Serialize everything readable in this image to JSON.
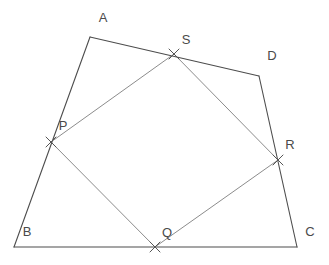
{
  "figure": {
    "width": 329,
    "height": 265,
    "background": "#ffffff"
  },
  "style": {
    "outer_stroke": "#4d4d4d",
    "inner_stroke": "#8c8c8c",
    "marker_stroke": "#555555",
    "label_color": "#4a4a4a",
    "outer_stroke_width": 1.1,
    "inner_stroke_width": 1.0,
    "marker_stroke_width": 1.0,
    "marker_size": 5,
    "label_font_size": 13
  },
  "outer_quadrilateral": {
    "name": "ABCD",
    "vertices": [
      {
        "id": "A",
        "label": "A",
        "x": 90,
        "y": 37,
        "label_x": 103,
        "label_y": 19
      },
      {
        "id": "D",
        "label": "D",
        "x": 259,
        "y": 76,
        "label_x": 272,
        "label_y": 57
      },
      {
        "id": "C",
        "label": "C",
        "x": 297,
        "y": 247,
        "label_x": 310,
        "label_y": 233
      },
      {
        "id": "B",
        "label": "B",
        "x": 14,
        "y": 247,
        "label_x": 27,
        "label_y": 233
      }
    ],
    "edges": [
      {
        "id": "AD",
        "from": "A",
        "to": "D"
      },
      {
        "id": "DC",
        "from": "D",
        "to": "C"
      },
      {
        "id": "CB",
        "from": "C",
        "to": "B"
      },
      {
        "id": "BA",
        "from": "B",
        "to": "A"
      }
    ]
  },
  "inner_quadrilateral": {
    "name": "PSRQ",
    "vertices": [
      {
        "id": "P",
        "label": "P",
        "x": 51,
        "y": 142,
        "label_x": 63,
        "label_y": 127,
        "on_edge": "BA"
      },
      {
        "id": "S",
        "label": "S",
        "x": 174,
        "y": 54,
        "label_x": 186,
        "label_y": 41,
        "on_edge": "AD"
      },
      {
        "id": "R",
        "label": "R",
        "x": 278,
        "y": 160,
        "label_x": 290,
        "label_y": 146,
        "on_edge": "DC"
      },
      {
        "id": "Q",
        "label": "Q",
        "x": 155,
        "y": 247,
        "label_x": 167,
        "label_y": 234,
        "on_edge": "CB"
      }
    ],
    "edges": [
      {
        "id": "PS",
        "from": "P",
        "to": "S"
      },
      {
        "id": "SR",
        "from": "S",
        "to": "R"
      },
      {
        "id": "RQ",
        "from": "R",
        "to": "Q"
      },
      {
        "id": "QP",
        "from": "Q",
        "to": "P"
      }
    ]
  },
  "markers": [
    {
      "id": "marker-P",
      "x": 51,
      "y": 142
    },
    {
      "id": "marker-S",
      "x": 174,
      "y": 54
    },
    {
      "id": "marker-R",
      "x": 278,
      "y": 160
    },
    {
      "id": "marker-Q",
      "x": 155,
      "y": 247
    }
  ],
  "chart_data": {
    "type": "diagram",
    "outer_points": {
      "A": [
        90,
        37
      ],
      "B": [
        14,
        247
      ],
      "C": [
        297,
        247
      ],
      "D": [
        259,
        76
      ]
    },
    "inner_points": {
      "P": [
        51,
        142
      ],
      "Q": [
        155,
        247
      ],
      "R": [
        278,
        160
      ],
      "S": [
        174,
        54
      ]
    },
    "outer_path": [
      "A",
      "D",
      "C",
      "B",
      "A"
    ],
    "inner_path": [
      "P",
      "S",
      "R",
      "Q",
      "P"
    ],
    "labels": [
      "A",
      "B",
      "C",
      "D",
      "P",
      "Q",
      "R",
      "S"
    ],
    "annotations": []
  }
}
